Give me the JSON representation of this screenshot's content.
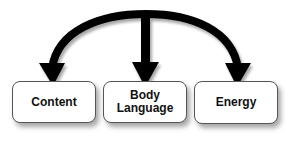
{
  "diagram": {
    "type": "one-to-many branching arrow",
    "arrow_color": "#000000",
    "nodes": [
      {
        "id": "content",
        "label": "Content"
      },
      {
        "id": "body-language",
        "label": "Body\nLanguage",
        "lines": [
          "Body",
          "Language"
        ]
      },
      {
        "id": "energy",
        "label": "Energy"
      }
    ],
    "edges": [
      {
        "from": "arc-top",
        "to": "content"
      },
      {
        "from": "arc-top",
        "to": "body-language"
      },
      {
        "from": "arc-top",
        "to": "energy"
      }
    ]
  }
}
